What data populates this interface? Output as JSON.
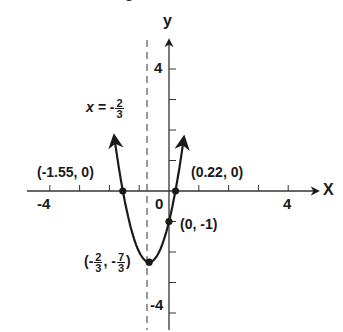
{
  "chart_data": {
    "type": "line",
    "title": "",
    "equation": "y = 3x^2 + 4x - 1",
    "xlabel": "x",
    "ylabel": "y",
    "xlim": [
      -4.8,
      5
    ],
    "ylim": [
      -4.6,
      5.2
    ],
    "grid": false,
    "x_ticks": [
      -4,
      -3,
      -2,
      -1,
      0,
      1,
      2,
      3,
      4
    ],
    "y_ticks": [
      -4,
      -3,
      -2,
      -1,
      1,
      2,
      3,
      4
    ],
    "x_tick_labels": [
      "-4",
      "0",
      "4"
    ],
    "y_tick_labels": [
      "4",
      "-4"
    ],
    "series": [
      {
        "name": "parabola",
        "x_range": [
          -1.84,
          0.5
        ],
        "curve": "y = 3x^2 + 4x - 1",
        "arrows_on_ends": true
      }
    ],
    "points": [
      {
        "label": "(-1.55, 0)",
        "x": -1.55,
        "y": 0
      },
      {
        "label": "(0.22, 0)",
        "x": 0.22,
        "y": 0
      },
      {
        "label": "(0, -1)",
        "x": 0,
        "y": -1
      },
      {
        "label": "(-2/3, -7/3)",
        "x": -0.6667,
        "y": -2.3333
      }
    ],
    "annotations": [
      {
        "text": "x = -2/3",
        "type": "axis-of-symmetry",
        "style": "dashed vertical line",
        "x": -0.6667
      }
    ]
  },
  "labels": {
    "x_axis": "X",
    "y_axis": "y",
    "tick_neg4_x": "-4",
    "tick_0": "0",
    "tick_4_x": "4",
    "tick_4_y": "4",
    "tick_neg4_y": "-4",
    "root_left": "(-1.55, 0)",
    "root_right": "(0.22, 0)",
    "y_intercept": "(0, -1)",
    "vertex_open": "(-",
    "vertex_num1": "2",
    "vertex_den1": "3",
    "vertex_mid": ", -",
    "vertex_num2": "7",
    "vertex_den2": "3",
    "vertex_close": ")",
    "symmetry_prefix": "x = -",
    "symmetry_num": "2",
    "symmetry_den": "3"
  },
  "colors": {
    "ink": "#1a1a1a",
    "axis": "#333333",
    "dashed": "#555555",
    "background": "#ffffff"
  }
}
